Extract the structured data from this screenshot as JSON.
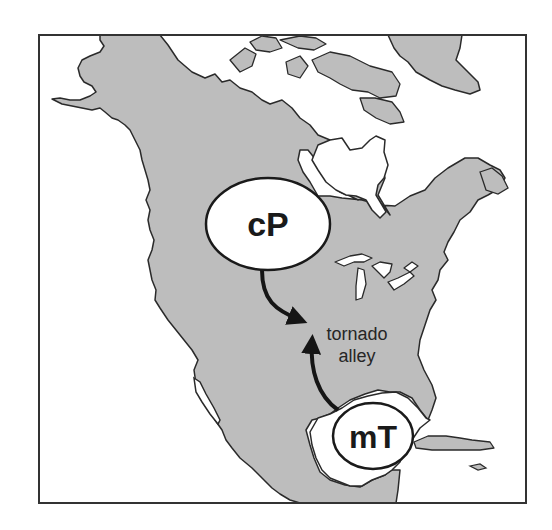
{
  "figure": {
    "colors": {
      "land": "#bdbdbd",
      "water": "#ffffff",
      "outline": "#2a2a2a",
      "arrow": "#151515",
      "frame": "#333333"
    }
  },
  "air_masses": [
    {
      "id": "cp",
      "label": "cP"
    },
    {
      "id": "mt",
      "label": "mT"
    }
  ],
  "region_label": {
    "line1": "tornado",
    "line2": "alley"
  }
}
